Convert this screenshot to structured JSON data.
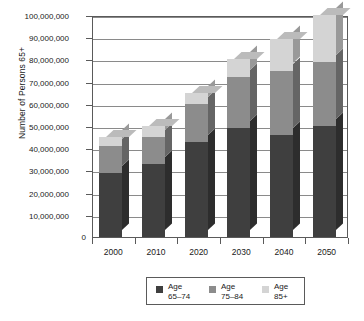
{
  "chart_data": {
    "type": "bar",
    "subtype": "stacked-column-3d",
    "title": "",
    "xlabel": "",
    "ylabel": "Number of Persons 65+",
    "categories": [
      "2000",
      "2010",
      "2020",
      "2030",
      "2040",
      "2050"
    ],
    "series": [
      {
        "name": "Age 65–74",
        "values": [
          29000000,
          33000000,
          43000000,
          49000000,
          46000000,
          50000000
        ]
      },
      {
        "name": "Age 75–84",
        "values": [
          12000000,
          12000000,
          17000000,
          23000000,
          29000000,
          29000000
        ]
      },
      {
        "name": "Age 85+",
        "values": [
          4000000,
          5000000,
          5000000,
          8000000,
          14000000,
          21000000
        ]
      }
    ],
    "stack_totals": [
      45000000,
      50000000,
      65000000,
      80000000,
      89000000,
      100000000
    ],
    "ylim": [
      0,
      100000000
    ],
    "ytick_values": [
      10000000,
      20000000,
      30000000,
      40000000,
      50000000,
      60000000,
      70000000,
      80000000,
      90000000,
      100000000
    ],
    "ytick_labels": [
      "10,000,000",
      "20,000,000",
      "30,000,000",
      "40,000,000",
      "50,000,000",
      "60,000,000",
      "70,000,000",
      "80,000,000",
      "90,000,000",
      "100,000,000"
    ],
    "zero_label": "0",
    "grid": true,
    "grid_axis": "y",
    "legend_position": "bottom",
    "legend_entries": [
      {
        "label_line1": "Age",
        "label_line2": "65–74",
        "color": "#3f3f3f"
      },
      {
        "label_line1": "Age",
        "label_line2": "75–84",
        "color": "#8c8c8c"
      },
      {
        "label_line1": "Age",
        "label_line2": "85+",
        "color": "#d4d4d4"
      }
    ],
    "colors": {
      "series_65_74": "#3f3f3f",
      "series_75_84": "#8c8c8c",
      "series_85_plus": "#d4d4d4",
      "axis": "#5a5a5a",
      "gridline": "#8a8a8a",
      "background": "#ffffff",
      "text": "#1a1a1a"
    }
  }
}
